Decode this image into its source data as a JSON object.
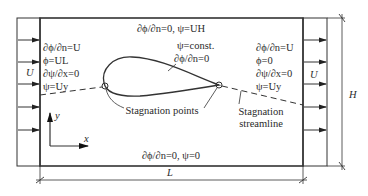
{
  "diagram": {
    "top_boundary": "∂ϕ/∂n=0, ψ=UH",
    "bottom_boundary": "∂ϕ/∂n=0, ψ=0",
    "inlet": {
      "velocity_label": "U",
      "conditions": [
        "∂ϕ/∂n=U",
        "ϕ=UL",
        "∂ψ/∂x=0",
        "ψ=Uy"
      ]
    },
    "outlet": {
      "velocity_label": "U",
      "conditions": [
        "∂ϕ/∂n=U",
        "ϕ=0",
        "∂ψ/∂x=0",
        "ψ=Uy"
      ]
    },
    "airfoil": {
      "conditions": [
        "ψ=const.",
        "∂ϕ/∂n=0"
      ]
    },
    "annotations": {
      "stagnation_points": "Stagnation points",
      "stagnation_streamline": [
        "Stagnation",
        "streamline"
      ]
    },
    "axes": {
      "x": "x",
      "y": "y"
    },
    "dimensions": {
      "width": "L",
      "height": "H"
    },
    "colors": {
      "line": "#333333",
      "text": "#2a2a2a",
      "background": "#ffffff"
    }
  }
}
